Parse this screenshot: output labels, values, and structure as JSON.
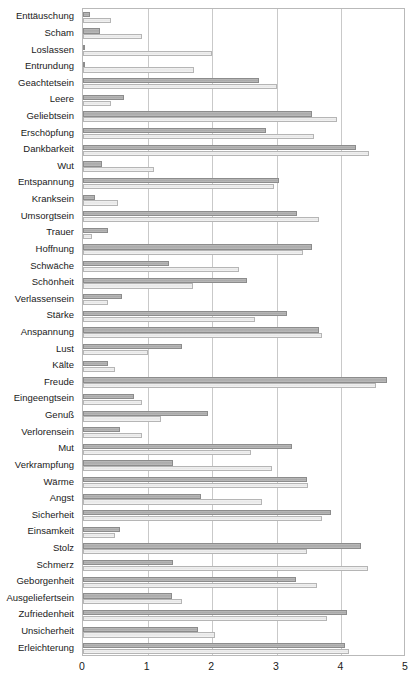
{
  "chart_data": {
    "type": "bar",
    "orientation": "horizontal",
    "title": "",
    "subtitle": "",
    "xlabel": "",
    "ylabel": "",
    "xlim": [
      0,
      5
    ],
    "xticks": [
      "0",
      "1",
      "2",
      "3",
      "4",
      "5"
    ],
    "grid": true,
    "legend_position": "none",
    "colors": {
      "series_1": "#b0b0b0",
      "series_2": "#ececec",
      "gridline": "#c9c9c9",
      "axis": "#b9b9b9",
      "text": "#1a1a1a"
    },
    "categories": [
      "Enttäuschung",
      "Scham",
      "Loslassen",
      "Entrundung",
      "Geachtetsein",
      "Leere",
      "Geliebtsein",
      "Erschöpfung",
      "Dankbarkeit",
      "Wut",
      "Entspannung",
      "Kranksein",
      "Umsorgtsein",
      "Trauer",
      "Hoffnung",
      "Schwäche",
      "Schönheit",
      "Verlassensein",
      "Stärke",
      "Anspannung",
      "Lust",
      "Kälte",
      "Freude",
      "Eingeengtsein",
      "Genuß",
      "Verlorensein",
      "Mut",
      "Verkrampfung",
      "Wärme",
      "Angst",
      "Sicherheit",
      "Einsamkeit",
      "Stolz",
      "Schmerz",
      "Geborgenheit",
      "Ausgeliefertsein",
      "Zufriedenheit",
      "Unsicherheit",
      "Erleichterung"
    ],
    "series": [
      {
        "name": "series_1",
        "style": "dark",
        "values": [
          0.11,
          0.26,
          0.02,
          0.02,
          2.72,
          0.63,
          3.55,
          2.83,
          4.23,
          0.3,
          3.03,
          0.19,
          3.32,
          0.38,
          3.55,
          1.33,
          2.54,
          0.6,
          3.16,
          3.65,
          1.54,
          0.39,
          4.7,
          0.79,
          1.93,
          0.58,
          3.23,
          1.39,
          3.47,
          1.82,
          3.84,
          0.57,
          4.3,
          1.39,
          3.3,
          1.37,
          4.08,
          1.78,
          4.05
        ]
      },
      {
        "name": "series_2",
        "style": "light",
        "values": [
          0.43,
          0.92,
          2.0,
          1.72,
          3.0,
          0.43,
          3.93,
          3.58,
          4.43,
          1.1,
          2.96,
          0.54,
          3.65,
          0.14,
          3.41,
          2.42,
          1.71,
          0.38,
          2.67,
          3.7,
          1.0,
          0.49,
          4.53,
          0.91,
          1.2,
          0.91,
          2.6,
          2.92,
          3.49,
          2.77,
          3.7,
          0.49,
          3.47,
          4.41,
          3.62,
          1.54,
          3.78,
          2.05,
          4.12
        ]
      }
    ]
  }
}
